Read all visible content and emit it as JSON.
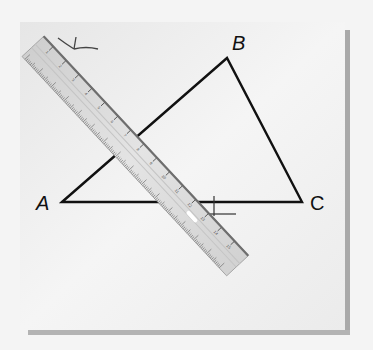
{
  "figure": {
    "vertices": [
      {
        "name": "A",
        "label": "A"
      },
      {
        "name": "B",
        "label": "B"
      },
      {
        "name": "C",
        "label": "C"
      }
    ],
    "ruler": {
      "tick_numbers": [
        "1",
        "2",
        "3",
        "4",
        "5",
        "6",
        "7",
        "8",
        "9",
        "10",
        "11",
        "12",
        "13",
        "14",
        "15"
      ]
    },
    "colors": {
      "background": "#f4f4f4",
      "paper": "#ededed",
      "shadow": "#a9a9a9",
      "line": "#111111",
      "ruler_body": "#d9d9d9",
      "ruler_edge": "#6e6e6e"
    }
  }
}
